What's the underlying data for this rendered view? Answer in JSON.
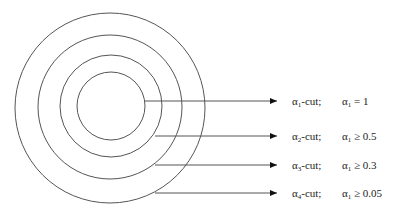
{
  "diagram": {
    "type": "nested alpha-cut circles",
    "colors": {
      "stroke": "#555555",
      "arrow": "#111111",
      "text": "#222222",
      "background": "#ffffff"
    },
    "circles": [
      {
        "id": 1,
        "cx": 111,
        "cy": 106,
        "r": 34
      },
      {
        "id": 2,
        "cx": 111,
        "cy": 106,
        "r": 51
      },
      {
        "id": 3,
        "cx": 110,
        "cy": 107,
        "r": 72
      },
      {
        "id": 4,
        "cx": 110,
        "cy": 108,
        "r": 95
      }
    ],
    "arrows": [
      {
        "id": 1,
        "x1": 145,
        "y": 101,
        "x2": 277
      },
      {
        "id": 2,
        "x1": 155,
        "y": 136,
        "x2": 277
      },
      {
        "id": 3,
        "x1": 155,
        "y": 165,
        "x2": 277
      },
      {
        "id": 4,
        "x1": 155,
        "y": 193,
        "x2": 277
      }
    ],
    "rows": [
      {
        "cut_symbol": "α",
        "cut_sub": "1",
        "cut_suffix": "-cut;",
        "cond_symbol": "α",
        "cond_sub": "1",
        "cond_relation": " = 1",
        "y": 95
      },
      {
        "cut_symbol": "α",
        "cut_sub": "2",
        "cut_suffix": "-cut;",
        "cond_symbol": "α",
        "cond_sub": "1",
        "cond_relation": " ≥ 0.5",
        "y": 130
      },
      {
        "cut_symbol": "α",
        "cut_sub": "3",
        "cut_suffix": "-cut;",
        "cond_symbol": "α",
        "cond_sub": "1",
        "cond_relation": " ≥ 0.3",
        "y": 159
      },
      {
        "cut_symbol": "α",
        "cut_sub": "4",
        "cut_suffix": "-cut;",
        "cond_symbol": "α",
        "cond_sub": "1",
        "cond_relation": " ≥ 0.05",
        "y": 187
      }
    ]
  }
}
